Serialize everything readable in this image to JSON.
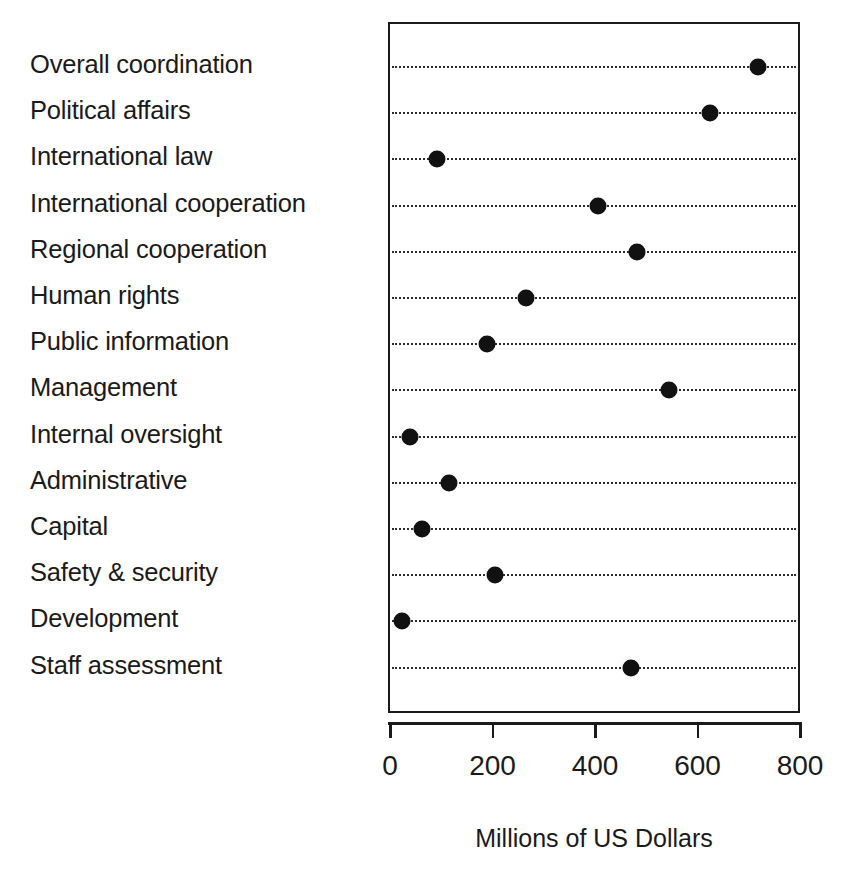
{
  "chart_data": {
    "type": "scatter",
    "subtype": "dot-plot",
    "title": "",
    "xlabel": "Millions of US Dollars",
    "ylabel": "",
    "xlim": [
      0,
      800
    ],
    "xticks": [
      0,
      200,
      400,
      600,
      800
    ],
    "xticklabels": [
      "0",
      "200",
      "400",
      "600",
      "800"
    ],
    "grid": "horizontal dotted leader lines",
    "legend": "none",
    "orientation": "horizontal",
    "marker": "filled circle",
    "marker_color": "#111111",
    "categories": [
      "Overall coordination",
      "Political affairs",
      "International law",
      "International cooperation",
      "Regional cooperation",
      "Human rights",
      "Public information",
      "Management",
      "Internal oversight",
      "Administrative",
      "Capital",
      "Safety & security",
      "Development",
      "Staff assessment"
    ],
    "values": [
      714,
      621,
      88,
      402,
      478,
      261,
      186,
      541,
      35,
      111,
      59,
      201,
      20,
      467
    ]
  },
  "axis": {
    "title": "Millions of US Dollars",
    "ticklabels": [
      "0",
      "200",
      "400",
      "600",
      "800"
    ]
  }
}
